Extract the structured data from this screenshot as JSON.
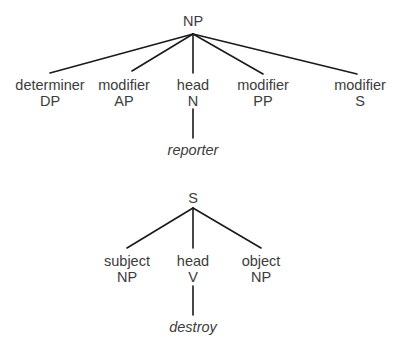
{
  "trees": [
    {
      "name": "np-tree",
      "root": {
        "label": "NP",
        "x": 193,
        "y": 26,
        "apex_y": 34
      },
      "children": [
        {
          "role": "determiner",
          "category": "DP",
          "x": 50,
          "line_end_y": 73
        },
        {
          "role": "modifier",
          "category": "AP",
          "x": 132,
          "line_end_y": 71
        },
        {
          "role": "head",
          "category": "N",
          "x": 193,
          "line_end_y": 73,
          "word": "reporter"
        },
        {
          "role": "modifier",
          "category": "PP",
          "x": 263,
          "line_end_y": 74
        },
        {
          "role": "modifier",
          "category": "S",
          "x": 357,
          "line_end_y": 74
        }
      ]
    },
    {
      "name": "s-tree",
      "root": {
        "label": "S",
        "x": 193,
        "y": 201,
        "apex_y": 207
      },
      "children": [
        {
          "role": "subject",
          "category": "NP",
          "x": 127,
          "line_end_y": 248
        },
        {
          "role": "head",
          "category": "V",
          "x": 193,
          "line_end_y": 248,
          "word": "destroy"
        },
        {
          "role": "object",
          "category": "NP",
          "x": 261,
          "line_end_y": 248
        }
      ]
    }
  ],
  "labels": {
    "np_root": "NP",
    "np_det_role": "determiner",
    "np_det_cat": "DP",
    "np_mod1_role": "modifier",
    "np_mod1_cat": "AP",
    "np_head_role": "head",
    "np_head_cat": "N",
    "np_head_word": "reporter",
    "np_mod2_role": "modifier",
    "np_mod2_cat": "PP",
    "np_mod3_role": "modifier",
    "np_mod3_cat": "S",
    "s_root": "S",
    "s_subj_role": "subject",
    "s_subj_cat": "NP",
    "s_head_role": "head",
    "s_head_cat": "V",
    "s_head_word": "destroy",
    "s_obj_role": "object",
    "s_obj_cat": "NP"
  },
  "colors": {
    "edge": "#1a1a1a",
    "text": "#3c3c3c",
    "background": "#ffffff"
  }
}
